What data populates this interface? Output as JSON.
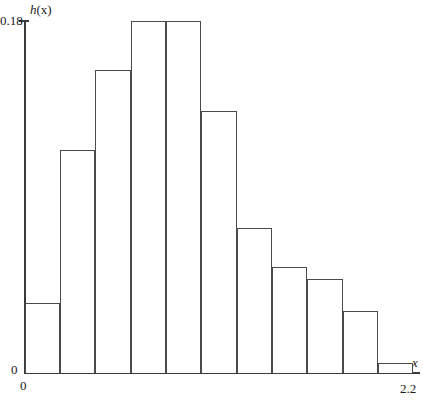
{
  "chart_data": {
    "type": "bar",
    "title": "",
    "subtitle": "",
    "xlabel": "x",
    "ylabel": "h(x)",
    "ylabel_function": "h",
    "ylabel_arg": "(x)",
    "xlim": [
      0,
      2.2
    ],
    "ylim": [
      0,
      0.18
    ],
    "x_tick_labels": [
      "0",
      "2.2"
    ],
    "y_tick_labels": [
      "0",
      "0.18"
    ],
    "grid": false,
    "legend": null,
    "bar_count": 11,
    "bin_width": 0.2,
    "bin_edges": [
      0,
      0.2,
      0.4,
      0.6,
      0.8,
      1.0,
      1.2,
      1.4,
      1.6,
      1.8,
      2.0,
      2.2
    ],
    "categories": [
      "0.0-0.2",
      "0.2-0.4",
      "0.4-0.6",
      "0.6-0.8",
      "0.8-1.0",
      "1.0-1.2",
      "1.2-1.4",
      "1.4-1.6",
      "1.6-1.8",
      "1.8-2.0",
      "2.0-2.2"
    ],
    "values": [
      0.036,
      0.114,
      0.155,
      0.18,
      0.18,
      0.134,
      0.074,
      0.054,
      0.048,
      0.032,
      0.005
    ],
    "bar_fill_color": "#ffffff",
    "bar_edge_color": "#4a4a4a",
    "axis_color": "#3a3a3a"
  },
  "axis": {
    "y_label_main": "h",
    "y_label_paren": "(x)",
    "y_tick_top": "0.18",
    "y_tick_zero": "0",
    "x_tick_zero": "0",
    "x_tick_max": "2.2",
    "x_label": "x"
  }
}
